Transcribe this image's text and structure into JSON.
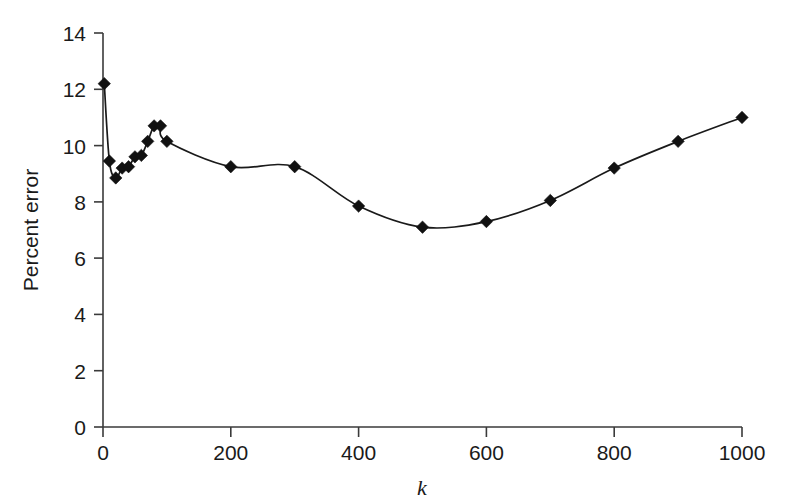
{
  "chart_data": {
    "type": "line",
    "title": "",
    "subtitle": "",
    "xlabel": "k",
    "ylabel": "Percent error",
    "xlim": [
      0,
      1000
    ],
    "ylim": [
      0,
      14
    ],
    "xticks": [
      0,
      200,
      400,
      600,
      800,
      1000
    ],
    "yticks": [
      0,
      2,
      4,
      6,
      8,
      10,
      12,
      14
    ],
    "xtick_labels": [
      "0",
      "200",
      "400",
      "600",
      "800",
      "1000"
    ],
    "ytick_labels": [
      "0",
      "2",
      "4",
      "6",
      "8",
      "10",
      "12",
      "14"
    ],
    "grid": false,
    "legend": false,
    "legend_position": "none",
    "marker": "diamond",
    "marker_color": "#111111",
    "line_color": "#1a1a1a",
    "series": [
      {
        "name": "Percent error",
        "x": [
          2,
          10,
          20,
          30,
          40,
          50,
          60,
          70,
          80,
          90,
          100,
          200,
          300,
          400,
          500,
          600,
          700,
          800,
          900,
          1000
        ],
        "y": [
          12.2,
          9.45,
          8.85,
          9.2,
          9.25,
          9.6,
          9.65,
          10.15,
          10.7,
          10.7,
          10.15,
          9.25,
          9.25,
          7.85,
          7.1,
          7.3,
          8.05,
          9.2,
          10.15,
          11.0
        ]
      }
    ]
  },
  "axes": {
    "y_axis_label": "Percent error",
    "x_axis_label": "k"
  }
}
